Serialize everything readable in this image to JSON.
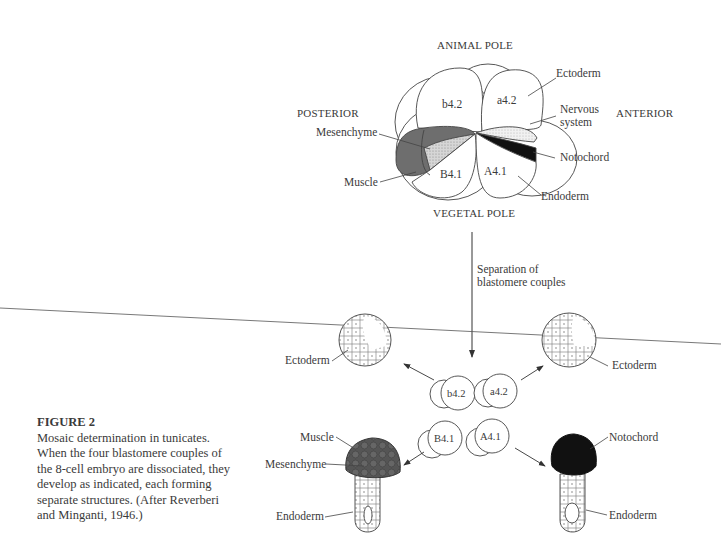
{
  "figure": {
    "number_label": "FIGURE 2",
    "caption": "Mosaic determination in tunicates. When the four blastomere couples of the 8-cell embryo are dissociated, they develop as indicated, each forming separate structures. (After Reverberi and Minganti, 1946.)"
  },
  "embryo": {
    "axis_labels": {
      "top": "ANIMAL POLE",
      "bottom": "VEGETAL POLE",
      "left": "POSTERIOR",
      "right": "ANTERIOR"
    },
    "blastomeres": [
      "b4.2",
      "a4.2",
      "B4.1",
      "A4.1"
    ],
    "fate_labels": {
      "ectoderm": "Ectoderm",
      "nervous_system_line1": "Nervous",
      "nervous_system_line2": "system",
      "notochord": "Notochord",
      "endoderm": "Endoderm",
      "mesenchyme": "Mesenchyme",
      "muscle": "Muscle"
    }
  },
  "arrow_label": {
    "line1": "Separation of",
    "line2": "blastomere couples"
  },
  "separated": {
    "pairs": [
      "b4.2",
      "a4.2",
      "B4.1",
      "A4.1"
    ],
    "outcomes": {
      "b42_result": "Ectoderm",
      "a42_result": "Ectoderm",
      "B41_muscle": "Muscle",
      "B41_mesenchyme": "Mesenchyme",
      "B41_endoderm": "Endoderm",
      "A41_notochord": "Notochord",
      "A41_endoderm": "Endoderm"
    }
  },
  "colors": {
    "ink": "#333333",
    "muscle_fill": "#6e6e6e",
    "mesenchyme_fill": "#b5b5b5",
    "notochord_fill": "#111111",
    "nervous_fill": "#e6e6e6"
  }
}
